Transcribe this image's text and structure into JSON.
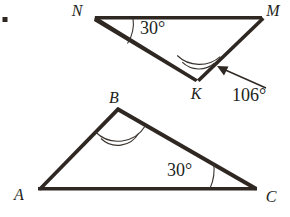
{
  "figure": {
    "kind": "geometry-diagram",
    "background_color": "#ffffff",
    "stroke_color": "#2e2722",
    "text_color": "#231f1c",
    "bullet": {
      "name": "list-bullet",
      "x": 4,
      "y": 19,
      "size": 5
    },
    "triangles": [
      {
        "id": "NMK",
        "name": "triangle-nmk",
        "vertices": [
          {
            "label": "N",
            "x": 95,
            "y": 16,
            "label_x": 77,
            "label_y": 12
          },
          {
            "label": "M",
            "x": 262,
            "y": 16,
            "label_x": 272,
            "label_y": 12
          },
          {
            "label": "K",
            "x": 197,
            "y": 78,
            "label_x": 196,
            "label_y": 95
          }
        ],
        "angles": [
          {
            "at": "N",
            "value": "30°",
            "marks": 1,
            "label_x": 140,
            "label_y": 35
          },
          {
            "at": "K",
            "value": "106°",
            "marks": 2,
            "label_x": 233,
            "label_y": 100,
            "has_leader_arrow": true
          }
        ]
      },
      {
        "id": "ABC",
        "name": "triangle-abc",
        "vertices": [
          {
            "label": "A",
            "x": 38,
            "y": 187,
            "label_x": 18,
            "label_y": 196
          },
          {
            "label": "B",
            "x": 118,
            "y": 108,
            "label_x": 112,
            "label_y": 100
          },
          {
            "label": "C",
            "x": 257,
            "y": 190,
            "label_x": 266,
            "label_y": 199
          }
        ],
        "angles": [
          {
            "at": "B",
            "value": "",
            "marks": 2,
            "label_x": 0,
            "label_y": 0
          },
          {
            "at": "C",
            "value": "30°",
            "marks": 1,
            "label_x": 168,
            "label_y": 178
          }
        ]
      }
    ],
    "leader_arrow": {
      "name": "angle-106-leader-arrow",
      "from_x": 266,
      "from_y": 88,
      "to_x": 218,
      "to_y": 66
    },
    "labels": {
      "N": "N",
      "M": "M",
      "K": "K",
      "A": "A",
      "B": "B",
      "C": "C",
      "angle_n": "30°",
      "angle_k": "106°",
      "angle_c": "30°"
    }
  }
}
